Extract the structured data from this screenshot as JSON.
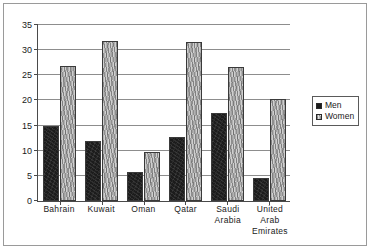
{
  "chart_data": {
    "type": "bar",
    "title": "",
    "subtitle": "",
    "xlabel": "",
    "ylabel": "",
    "ylim": [
      0,
      35
    ],
    "ytick_step": 5,
    "yticks": [
      0,
      5,
      10,
      15,
      20,
      25,
      30,
      35
    ],
    "ytick_labels": [
      "0",
      "5",
      "10",
      "15",
      "20",
      "25",
      "30",
      "35"
    ],
    "grid": true,
    "grid_axis": "y",
    "legend_position": "right",
    "categories": [
      "Bahrain",
      "Kuwait",
      "Oman",
      "Qatar",
      "Saudi Arabia",
      "United Arab Emirates"
    ],
    "category_label_lines": [
      [
        "Bahrain"
      ],
      [
        "Kuwait"
      ],
      [
        "Oman"
      ],
      [
        "Qatar"
      ],
      [
        "Saudi",
        "Arabia"
      ],
      [
        "United",
        "Arab",
        "Emirates"
      ]
    ],
    "series": [
      {
        "name": "Men",
        "color": "#1c1c1c",
        "pattern": "solid-dark",
        "values": [
          15.0,
          12.0,
          5.8,
          12.8,
          17.6,
          4.6
        ]
      },
      {
        "name": "Women",
        "color": "#cfcfcf",
        "pattern": "speckled-light",
        "values": [
          26.9,
          31.8,
          9.7,
          31.7,
          26.7,
          20.3
        ]
      }
    ]
  },
  "legend": {
    "items": [
      {
        "label": "Men",
        "swatch": "men-swatch-icon"
      },
      {
        "label": "Women",
        "swatch": "women-swatch-icon"
      }
    ]
  },
  "colors": {
    "men": "#1c1c1c",
    "women": "#cfcfcf",
    "gridline": "#8d8d8d",
    "axis": "#4a4a4a",
    "frame": "#9a9a9a",
    "text": "#1a1a1a",
    "background": "#ffffff"
  }
}
